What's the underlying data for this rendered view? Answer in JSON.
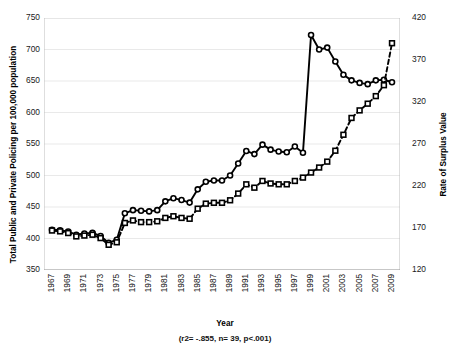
{
  "chart_data": {
    "type": "line",
    "title": "",
    "xlabel": "Year",
    "ylabel": "Total Public and Private Policing per 100,000 population",
    "ylabel_secondary": "Rate of Surplus Value",
    "annotation": "(r2= -.855, n= 39, p<.001)",
    "grid": true,
    "legend_position": "none",
    "ylim": [
      350,
      750
    ],
    "yticks": [
      350,
      400,
      450,
      500,
      550,
      600,
      650,
      700,
      750
    ],
    "ylim_secondary": [
      120,
      420
    ],
    "yticks_secondary": [
      120,
      170,
      220,
      270,
      320,
      370,
      420
    ],
    "x": [
      1967,
      1968,
      1969,
      1970,
      1971,
      1972,
      1973,
      1974,
      1975,
      1976,
      1977,
      1978,
      1979,
      1980,
      1981,
      1982,
      1983,
      1984,
      1985,
      1986,
      1987,
      1988,
      1989,
      1990,
      1991,
      1992,
      1993,
      1994,
      1995,
      1996,
      1997,
      1998,
      1999,
      2000,
      2001,
      2002,
      2003,
      2004,
      2005,
      2006,
      2007,
      2008,
      2009
    ],
    "xticks": [
      1967,
      1969,
      1971,
      1973,
      1975,
      1977,
      1979,
      1981,
      1983,
      1985,
      1987,
      1989,
      1991,
      1993,
      1995,
      1997,
      1999,
      2001,
      2003,
      2005,
      2007,
      2009
    ],
    "series": [
      {
        "name": "Total Public and Private Policing per 100,000 population",
        "axis": "left",
        "marker": "circle",
        "linestyle": "solid",
        "color": "#000000",
        "values": [
          414,
          413,
          411,
          406,
          408,
          409,
          404,
          393,
          398,
          440,
          445,
          444,
          443,
          445,
          459,
          464,
          461,
          457,
          478,
          490,
          492,
          492,
          500,
          519,
          539,
          534,
          549,
          541,
          538,
          537,
          546,
          536,
          723,
          700,
          703,
          681,
          660,
          651,
          647,
          645,
          651,
          652,
          648
        ]
      },
      {
        "name": "Rate of Surplus Value",
        "axis": "right",
        "marker": "square",
        "linestyle": "dashed",
        "color": "#000000",
        "values": [
          167,
          166,
          164,
          160,
          161,
          162,
          158,
          150,
          153,
          176,
          179,
          177,
          177,
          178,
          182,
          184,
          182,
          181,
          193,
          199,
          200,
          200,
          203,
          211,
          222,
          218,
          226,
          223,
          222,
          222,
          226,
          230,
          236,
          242,
          249,
          262,
          281,
          301,
          310,
          318,
          327,
          340,
          390
        ]
      }
    ]
  }
}
